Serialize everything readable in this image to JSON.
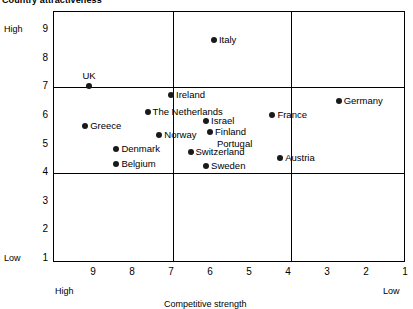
{
  "chart_data": {
    "type": "scatter",
    "title": "Country attractiveness",
    "xlabel": "Competitive strength",
    "ylabel": "Country attractiveness",
    "xlim": [
      9.6,
      0.8
    ],
    "ylim": [
      0.6,
      9.5
    ],
    "x_axis_reversed": true,
    "grid": "quadrant lines at x = 7 and x = 4, y = 7 and y = 4",
    "legend": "none",
    "x_ticks": [
      "9",
      "8",
      "7",
      "6",
      "5",
      "4",
      "3",
      "2",
      "1"
    ],
    "y_ticks": [
      "9",
      "8",
      "7",
      "6",
      "5",
      "4",
      "3",
      "2",
      "1"
    ],
    "x_end_labels": {
      "left": "High",
      "right": "Low"
    },
    "y_end_labels": {
      "top": "High",
      "bottom": "Low"
    },
    "quadrant_lines": {
      "vertical": [
        7,
        4
      ],
      "horizontal": [
        7,
        4
      ]
    },
    "points": [
      {
        "name": "Italy",
        "x": 5.9,
        "y": 8.6,
        "label_pos": "right"
      },
      {
        "name": "UK",
        "x": 9.1,
        "y": 7.0,
        "label_pos": "above"
      },
      {
        "name": "Ireland",
        "x": 7.0,
        "y": 6.7,
        "label_pos": "right"
      },
      {
        "name": "Germany",
        "x": 2.7,
        "y": 6.5,
        "label_pos": "right"
      },
      {
        "name": "The Netherlands",
        "x": 7.6,
        "y": 6.1,
        "label_pos": "right"
      },
      {
        "name": "France",
        "x": 4.4,
        "y": 6.0,
        "label_pos": "right"
      },
      {
        "name": "Israel",
        "x": 6.1,
        "y": 5.8,
        "label_pos": "right"
      },
      {
        "name": "Greece",
        "x": 9.2,
        "y": 5.6,
        "label_pos": "right"
      },
      {
        "name": "Finland",
        "x": 6.0,
        "y": 5.4,
        "label_pos": "right"
      },
      {
        "name": "Norway",
        "x": 7.3,
        "y": 5.3,
        "label_pos": "right"
      },
      {
        "name": "Portugal",
        "x": 5.9,
        "y": 5.0,
        "label_pos": "label-only"
      },
      {
        "name": "Denmark",
        "x": 8.4,
        "y": 4.8,
        "label_pos": "right"
      },
      {
        "name": "Switzerland",
        "x": 6.5,
        "y": 4.7,
        "label_pos": "right"
      },
      {
        "name": "Austria",
        "x": 4.2,
        "y": 4.5,
        "label_pos": "right"
      },
      {
        "name": "Belgium",
        "x": 8.4,
        "y": 4.3,
        "label_pos": "right"
      },
      {
        "name": "Sweden",
        "x": 6.1,
        "y": 4.2,
        "label_pos": "right"
      }
    ],
    "colors": {
      "point": "#1a1a1a",
      "axis": "#000000",
      "background": "#ffffff"
    }
  }
}
